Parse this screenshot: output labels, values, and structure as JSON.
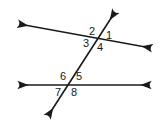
{
  "figure": {
    "background_color": "#ffffff",
    "stroke_color": "#1a1a1a",
    "label_color": "#1a1a1a",
    "stroke_width": 1.6,
    "width": 160,
    "height": 127
  },
  "lines": [
    {
      "name": "upper-line",
      "x1": 19,
      "y1": 24,
      "x2": 151,
      "y2": 48,
      "arrow_start": true,
      "arrow_end": true
    },
    {
      "name": "lower-line",
      "x1": 19,
      "y1": 85,
      "x2": 150,
      "y2": 85,
      "arrow_start": true,
      "arrow_end": true
    },
    {
      "name": "transversal-line",
      "x1": 115,
      "y1": 12,
      "x2": 48,
      "y2": 116,
      "arrow_start": true,
      "arrow_end": true
    }
  ],
  "intersections": [
    {
      "name": "upper-intersection",
      "x": 97,
      "y": 40
    },
    {
      "name": "lower-intersection",
      "x": 70,
      "y": 85
    }
  ],
  "labels": [
    {
      "id": "angle-1",
      "text": "1",
      "x": 106,
      "y": 30,
      "position": "upper-right"
    },
    {
      "id": "angle-2",
      "text": "2",
      "x": 89,
      "y": 26,
      "position": "upper-left"
    },
    {
      "id": "angle-3",
      "text": "3",
      "x": 83,
      "y": 38,
      "position": "lower-left"
    },
    {
      "id": "angle-4",
      "text": "4",
      "x": 97,
      "y": 42,
      "position": "lower-right"
    },
    {
      "id": "angle-5",
      "text": "5",
      "x": 76,
      "y": 71,
      "position": "upper-right"
    },
    {
      "id": "angle-6",
      "text": "6",
      "x": 60,
      "y": 71,
      "position": "upper-left"
    },
    {
      "id": "angle-7",
      "text": "7",
      "x": 55,
      "y": 87,
      "position": "lower-left"
    },
    {
      "id": "angle-8",
      "text": "8",
      "x": 71,
      "y": 87,
      "position": "lower-right"
    }
  ]
}
